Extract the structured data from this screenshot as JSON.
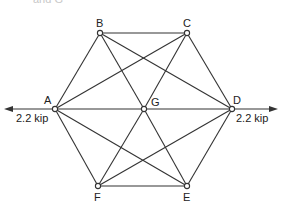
{
  "top_fragment": "and G",
  "diagram": {
    "type": "truss",
    "joints": {
      "A": {
        "label": "A",
        "x": 55,
        "y": 109
      },
      "B": {
        "label": "B",
        "x": 100,
        "y": 33
      },
      "C": {
        "label": "C",
        "x": 187,
        "y": 33
      },
      "D": {
        "label": "D",
        "x": 232,
        "y": 109
      },
      "E": {
        "label": "E",
        "x": 187,
        "y": 186
      },
      "F": {
        "label": "F",
        "x": 98,
        "y": 186
      },
      "G": {
        "label": "G",
        "x": 144,
        "y": 109
      }
    },
    "members": [
      [
        "B",
        "C"
      ],
      [
        "A",
        "B"
      ],
      [
        "C",
        "D"
      ],
      [
        "A",
        "G"
      ],
      [
        "G",
        "D"
      ],
      [
        "B",
        "G"
      ],
      [
        "B",
        "D"
      ],
      [
        "A",
        "C"
      ],
      [
        "C",
        "G"
      ],
      [
        "A",
        "F"
      ],
      [
        "A",
        "E"
      ],
      [
        "G",
        "F"
      ],
      [
        "G",
        "E"
      ],
      [
        "D",
        "F"
      ],
      [
        "D",
        "E"
      ],
      [
        "F",
        "E"
      ]
    ],
    "loads": {
      "left": {
        "label": "2.2 kip",
        "joint": "A",
        "direction": "left"
      },
      "right": {
        "label": "2.2 kip",
        "joint": "D",
        "direction": "right"
      }
    },
    "labels": {
      "A": "A",
      "B": "B",
      "C": "C",
      "D": "D",
      "E": "E",
      "F": "F",
      "G": "G"
    }
  }
}
